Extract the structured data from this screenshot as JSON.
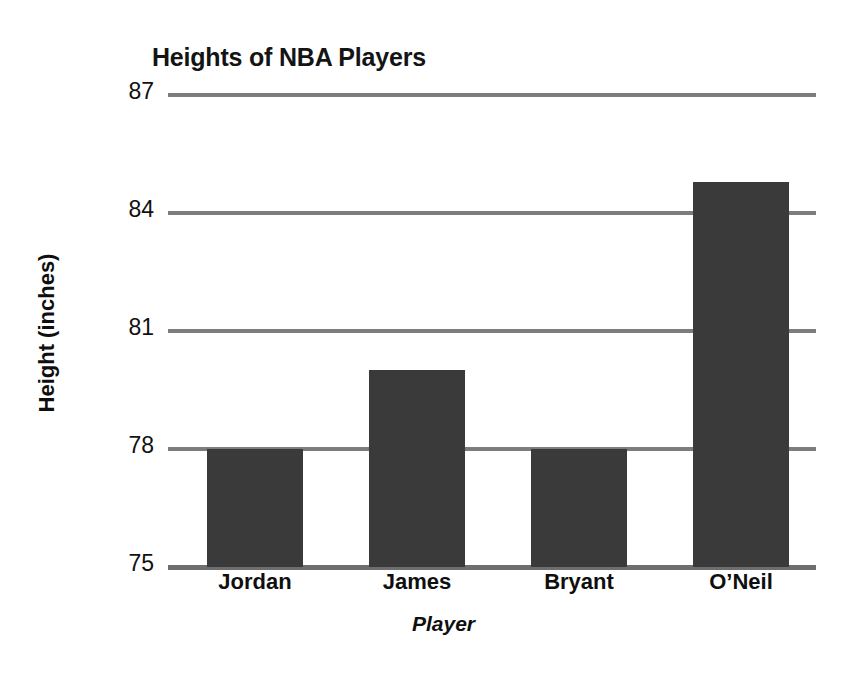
{
  "chart_data": {
    "type": "bar",
    "title": "Heights of NBA Players",
    "xlabel": "Player",
    "ylabel": "Height (inches)",
    "categories": [
      "Jordan",
      "James",
      "Bryant",
      "O’Neil"
    ],
    "values": [
      78,
      80,
      78,
      84.8
    ],
    "ylim": [
      75,
      87
    ],
    "yticks": [
      75,
      78,
      81,
      84,
      87
    ],
    "ytick_labels": [
      "75",
      "78",
      "81",
      "84",
      "87"
    ],
    "grid": true,
    "legend": "none",
    "bar_color": "#3a3a3a",
    "gridline_color": "#7d7d7d",
    "background_color": "#ffffff"
  },
  "chart": {
    "title": "Heights of NBA Players",
    "y_axis_title": "Height (inches)",
    "x_axis_title": "Player",
    "y_ticks": [
      {
        "label": "87",
        "value": 87
      },
      {
        "label": "84",
        "value": 84
      },
      {
        "label": "81",
        "value": 81
      },
      {
        "label": "78",
        "value": 78
      },
      {
        "label": "75",
        "value": 75
      }
    ],
    "bars": [
      {
        "label": "Jordan",
        "value": 78
      },
      {
        "label": "James",
        "value": 80
      },
      {
        "label": "Bryant",
        "value": 78
      },
      {
        "label": "O’Neil",
        "value": 84.8
      }
    ]
  }
}
